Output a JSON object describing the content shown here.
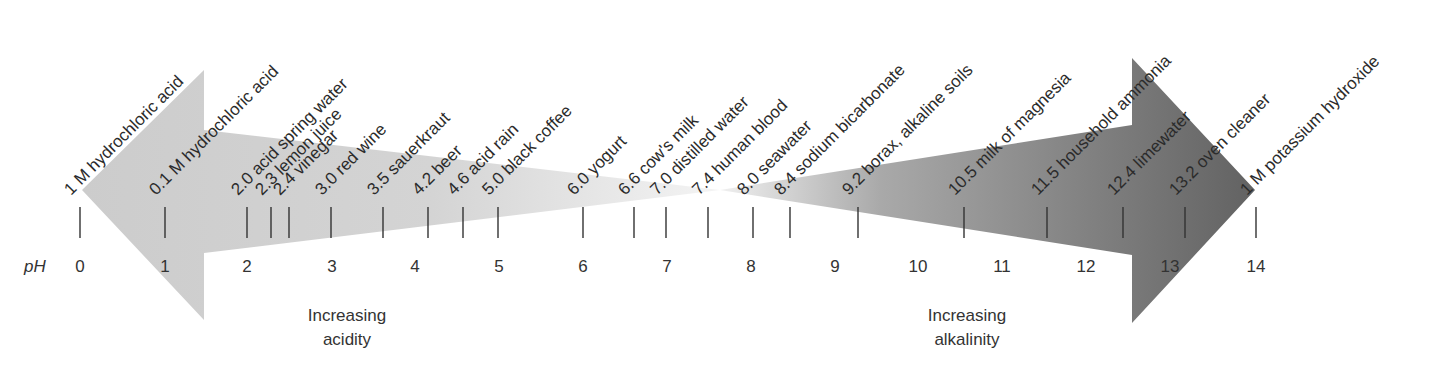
{
  "axis": {
    "label": "pH",
    "numbers": [
      "0",
      "1",
      "2",
      "3",
      "4",
      "5",
      "6",
      "7",
      "8",
      "9",
      "10",
      "11",
      "12",
      "13",
      "14"
    ],
    "number_x": [
      80,
      165,
      247,
      332,
      415,
      499,
      583,
      667,
      751,
      835,
      918,
      1002,
      1086,
      1170,
      1256
    ]
  },
  "captions": {
    "acidity_line1": "Increasing",
    "acidity_line2": "acidity",
    "alkalinity_line1": "Increasing",
    "alkalinity_line2": "alkalinity"
  },
  "colors": {
    "acid_arrow": "#cfcfcf",
    "acid_arrow_fade": "#f2f2f2",
    "base_arrow": "#6b6b6b",
    "base_arrow_fade": "#f0f0f0",
    "tick": "#333333"
  },
  "items": [
    {
      "text": "1 M hydrochloric acid",
      "x": 80
    },
    {
      "text": "0.1 M hydrochloric acid",
      "x": 165
    },
    {
      "text": "2.0 acid spring water",
      "x": 247
    },
    {
      "text": "2.3 lemon juice",
      "x": 271
    },
    {
      "text": "2.4 vinegar",
      "x": 289
    },
    {
      "text": "3.0 red wine",
      "x": 331
    },
    {
      "text": "3.5 sauerkraut",
      "x": 383
    },
    {
      "text": "4.2 beer",
      "x": 428
    },
    {
      "text": "4.6 acid rain",
      "x": 463
    },
    {
      "text": "5.0 black coffee",
      "x": 498
    },
    {
      "text": "6.0 yogurt",
      "x": 583
    },
    {
      "text": "6.6 cow's milk",
      "x": 634
    },
    {
      "text": "7.0 distilled water",
      "x": 666
    },
    {
      "text": "7.4 human blood",
      "x": 708
    },
    {
      "text": "8.0 seawater",
      "x": 753
    },
    {
      "text": "8.4 sodium bicarbonate",
      "x": 790
    },
    {
      "text": "9.2 borax, alkaline soils",
      "x": 858
    },
    {
      "text": "10.5 milk of magnesia",
      "x": 964
    },
    {
      "text": "11.5 household ammonia",
      "x": 1047
    },
    {
      "text": "12.4 limewater",
      "x": 1123
    },
    {
      "text": "13.2 oven cleaner",
      "x": 1185
    },
    {
      "text": "1 M potassium hydroxide",
      "x": 1256
    }
  ]
}
